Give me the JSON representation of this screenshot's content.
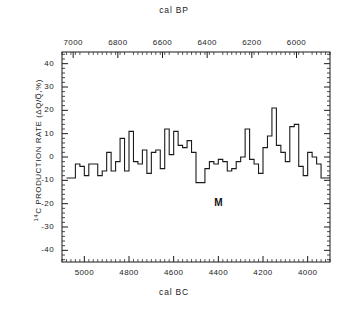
{
  "figure": {
    "top_axis_title": "cal BP",
    "bottom_axis_title": "cal BC",
    "y_axis_label_prefix": "14",
    "y_axis_label_main": "C PRODUCTION RATE",
    "y_axis_label_units": "(ΔQ/Q̅,%)",
    "annotation": "M",
    "line_color": "#1a1a1a",
    "frame_color": "#1a1a1a",
    "background_color": "#ffffff"
  },
  "chart_data": {
    "type": "line",
    "title": "",
    "subtitle": "",
    "xlabel": "cal BC",
    "ylabel": "14C PRODUCTION RATE (ΔQ/Q,%)",
    "x_top_label": "cal BP",
    "grid": false,
    "legend": "none",
    "drawstyle": "steps-post",
    "xlim": [
      -5100,
      -3900
    ],
    "ylim": [
      -45,
      45
    ],
    "x_top_lim": [
      7050,
      5850
    ],
    "yticks": [
      40,
      30,
      20,
      10,
      0,
      -10,
      -20,
      -30,
      -40
    ],
    "ytick_labels": [
      "40",
      "30",
      "20",
      "10",
      "0",
      "-10",
      "-20",
      "-30",
      "-40"
    ],
    "xticks_bottom": [
      -5000,
      -4800,
      -4600,
      -4400,
      -4200,
      -4000
    ],
    "xtick_labels_bottom": [
      "5000",
      "4800",
      "4600",
      "4400",
      "4200",
      "4000"
    ],
    "xticks_top": [
      7000,
      6800,
      6600,
      6400,
      6200,
      6000
    ],
    "xtick_labels_top": [
      "7000",
      "6800",
      "6600",
      "6400",
      "6200",
      "6000"
    ],
    "minor_tick_interval_x": 20,
    "minor_tick_interval_y": 2,
    "annotations": [
      {
        "text": "M",
        "x": -4400,
        "y": -20
      }
    ],
    "series": [
      {
        "name": "14C production rate",
        "x": [
          -5080,
          -5060,
          -5040,
          -5020,
          -5000,
          -4980,
          -4960,
          -4940,
          -4920,
          -4900,
          -4880,
          -4860,
          -4840,
          -4820,
          -4800,
          -4780,
          -4760,
          -4740,
          -4720,
          -4700,
          -4680,
          -4660,
          -4640,
          -4620,
          -4600,
          -4580,
          -4560,
          -4540,
          -4520,
          -4500,
          -4480,
          -4460,
          -4440,
          -4420,
          -4400,
          -4380,
          -4360,
          -4340,
          -4320,
          -4300,
          -4280,
          -4260,
          -4240,
          -4220,
          -4200,
          -4180,
          -4160,
          -4140,
          -4120,
          -4100,
          -4080,
          -4060,
          -4040,
          -4020,
          -4000,
          -3980,
          -3960,
          -3940,
          -3920
        ],
        "values": [
          -9,
          -9,
          -3,
          -4,
          -8,
          -3,
          -3,
          -8,
          -6,
          2,
          -6,
          -2,
          8,
          -6,
          11,
          -2,
          -3,
          3,
          -7,
          2,
          3,
          -5,
          12,
          1,
          11,
          5,
          4,
          7,
          2,
          -11,
          -11,
          -5,
          -2,
          -3,
          -1,
          -2,
          -6,
          -5,
          -2,
          0,
          12,
          -1,
          -3,
          -7,
          4,
          9,
          21,
          5,
          2,
          -2,
          13,
          14,
          -4,
          -8,
          2,
          0,
          -3,
          -9,
          -9
        ]
      }
    ]
  }
}
